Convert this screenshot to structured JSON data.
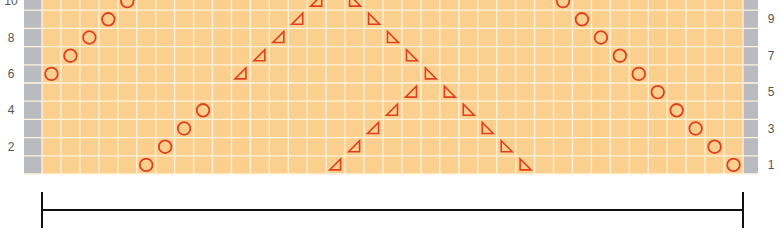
{
  "chart_data": {
    "type": "knitting-chart",
    "columns": 37,
    "rows_visible": 10,
    "colors": {
      "cell": "#fbd08e",
      "grid": "#fff3dc",
      "edge": "#b9bbbe",
      "mark": "#e0401e"
    },
    "left_labels": [
      "2",
      "4",
      "6",
      "8",
      "10"
    ],
    "right_labels": [
      "1",
      "3",
      "5",
      "7",
      "9"
    ],
    "marks": [
      {
        "type": "circle",
        "row": 1,
        "col": 5
      },
      {
        "type": "circle",
        "row": 2,
        "col": 6
      },
      {
        "type": "circle",
        "row": 3,
        "col": 7
      },
      {
        "type": "circle",
        "row": 4,
        "col": 8
      },
      {
        "type": "circle",
        "row": 6,
        "col": 0
      },
      {
        "type": "circle",
        "row": 7,
        "col": 1
      },
      {
        "type": "circle",
        "row": 8,
        "col": 2
      },
      {
        "type": "circle",
        "row": 9,
        "col": 3
      },
      {
        "type": "circle",
        "row": 10,
        "col": 4
      },
      {
        "type": "tri-left",
        "row": 1,
        "col": 15
      },
      {
        "type": "tri-left",
        "row": 2,
        "col": 16
      },
      {
        "type": "tri-left",
        "row": 3,
        "col": 17
      },
      {
        "type": "tri-left",
        "row": 4,
        "col": 18
      },
      {
        "type": "tri-left",
        "row": 5,
        "col": 19
      },
      {
        "type": "tri-left",
        "row": 6,
        "col": 10
      },
      {
        "type": "tri-left",
        "row": 7,
        "col": 11
      },
      {
        "type": "tri-left",
        "row": 8,
        "col": 12
      },
      {
        "type": "tri-left",
        "row": 9,
        "col": 13
      },
      {
        "type": "tri-left",
        "row": 10,
        "col": 14
      },
      {
        "type": "tri-right",
        "row": 10,
        "col": 16
      },
      {
        "type": "tri-right",
        "row": 9,
        "col": 17
      },
      {
        "type": "tri-right",
        "row": 8,
        "col": 18
      },
      {
        "type": "tri-right",
        "row": 7,
        "col": 19
      },
      {
        "type": "tri-right",
        "row": 6,
        "col": 20
      },
      {
        "type": "tri-right",
        "row": 5,
        "col": 21
      },
      {
        "type": "tri-right",
        "row": 4,
        "col": 22
      },
      {
        "type": "tri-right",
        "row": 3,
        "col": 23
      },
      {
        "type": "tri-right",
        "row": 2,
        "col": 24
      },
      {
        "type": "tri-right",
        "row": 1,
        "col": 25
      },
      {
        "type": "circle",
        "row": 10,
        "col": 27
      },
      {
        "type": "circle",
        "row": 9,
        "col": 28
      },
      {
        "type": "circle",
        "row": 8,
        "col": 29
      },
      {
        "type": "circle",
        "row": 7,
        "col": 30
      },
      {
        "type": "circle",
        "row": 6,
        "col": 31
      },
      {
        "type": "circle",
        "row": 5,
        "col": 32
      },
      {
        "type": "circle",
        "row": 4,
        "col": 33
      },
      {
        "type": "circle",
        "row": 3,
        "col": 34
      },
      {
        "type": "circle",
        "row": 2,
        "col": 35
      },
      {
        "type": "circle",
        "row": 1,
        "col": 36
      }
    ],
    "repeat_bracket": {
      "from_x": 42,
      "to_x": 743
    }
  }
}
